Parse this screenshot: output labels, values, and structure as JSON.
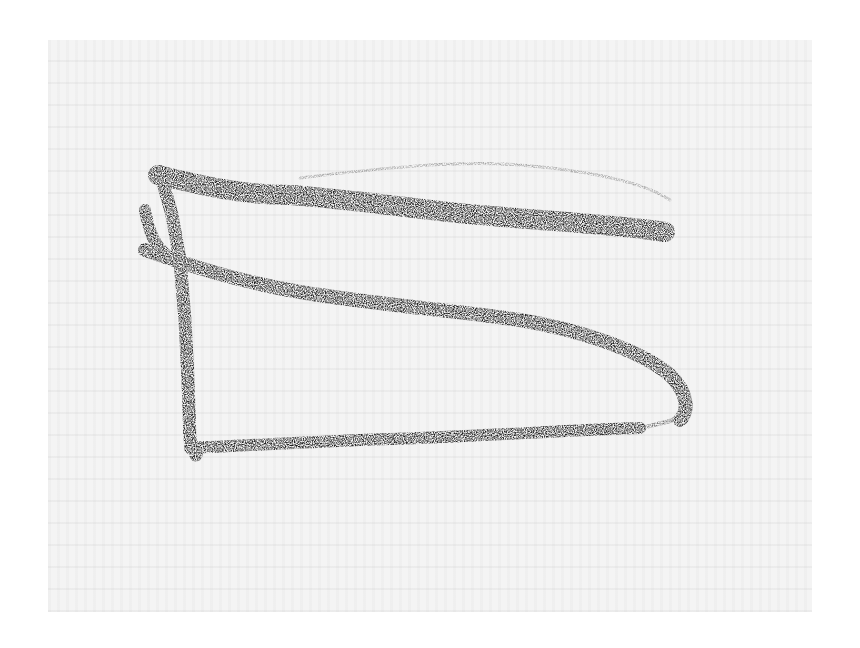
{
  "image": {
    "description": "Scanned crayon drawing of a flag on a pole over faint show-through text",
    "stroke_color": "#1a1a1a",
    "paper_color": "#f4f4f4",
    "border_color": "#ffffff"
  }
}
